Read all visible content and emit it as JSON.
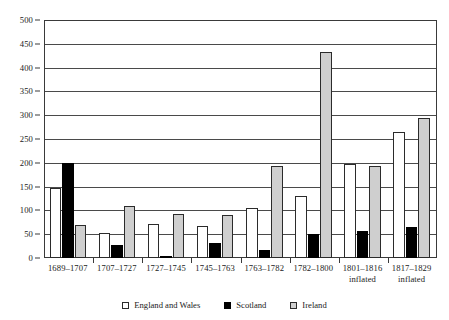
{
  "chart_data": {
    "type": "bar",
    "title": "",
    "subtitle": "",
    "xlabel": "",
    "ylabel": "",
    "ylim": [
      0,
      500
    ],
    "yticks": [
      0,
      50,
      100,
      150,
      200,
      250,
      300,
      350,
      400,
      450,
      500
    ],
    "grid": true,
    "legend_position": "bottom",
    "categories": [
      "1689–1707",
      "1707–1727",
      "1727–1745",
      "1745–1763",
      "1763–1782",
      "1782–1800",
      "1801–1816",
      "1817–1829"
    ],
    "category_sublabels": [
      "",
      "",
      "",
      "",
      "",
      "",
      "inflated",
      "inflated"
    ],
    "series": [
      {
        "name": "England and Wales",
        "color": "#ffffff",
        "values": [
          148,
          53,
          72,
          67,
          105,
          131,
          198,
          265
        ]
      },
      {
        "name": "Scotland",
        "color": "#000000",
        "values": [
          200,
          27,
          5,
          32,
          17,
          51,
          57,
          65
        ]
      },
      {
        "name": "Ireland",
        "color": "#cfcfcf",
        "values": [
          70,
          110,
          93,
          90,
          193,
          432,
          194,
          295
        ]
      }
    ]
  },
  "legend": {
    "items": [
      {
        "label": "England and Wales",
        "swatch": "ew"
      },
      {
        "label": "Scotland",
        "swatch": "scot"
      },
      {
        "label": "Ireland",
        "swatch": "ire"
      }
    ]
  }
}
